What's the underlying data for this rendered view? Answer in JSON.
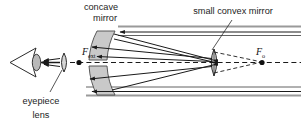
{
  "diagram": {
    "labels": {
      "concave_mirror_line1": "concave",
      "concave_mirror_line2": "mirror",
      "convex_mirror": "small convex mirror",
      "eyepiece_line1": "eyepiece",
      "eyepiece_line2": "lens",
      "focus_external": "F",
      "focus_external_sub": "ext",
      "focus_objective": "F",
      "focus_objective_sub": "o"
    },
    "colors": {
      "ink": "#1d1d1d",
      "ray": "#1a1a1a",
      "mirror_fill": "#c9c9c9",
      "mirror_stroke": "#3a3a3a",
      "tube_wall": "#9a9a9a",
      "background": "#ffffff",
      "dot": "#111111"
    },
    "components": [
      {
        "name": "concave-mirror",
        "role": "primary objective mirror",
        "shape": "curved gray band"
      },
      {
        "name": "small-convex-mirror",
        "role": "secondary mirror",
        "shape": "vertical lens profile"
      },
      {
        "name": "eyepiece-lens",
        "role": "eyepiece",
        "shape": "small vertical lens"
      },
      {
        "name": "eye",
        "role": "observer",
        "shape": "triangle with pupil"
      },
      {
        "name": "telescope-tube",
        "role": "body tube walls",
        "shape": "horizontal gray rails"
      }
    ],
    "rays": {
      "incoming_direction": "right-to-left",
      "style_virtual": "dashed",
      "style_real": "solid"
    }
  }
}
